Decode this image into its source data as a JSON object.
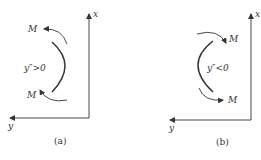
{
  "diagram": {
    "colors": {
      "line": "#333333",
      "background": "#ffffff"
    },
    "panels": [
      {
        "id": "a",
        "caption": "(a)",
        "x_axis_label": "x",
        "y_axis_label": "y",
        "moment_top_label": "M",
        "moment_bottom_label": "M",
        "curvature_label": "y″>0",
        "curve_bulge": "right"
      },
      {
        "id": "b",
        "caption": "(b)",
        "x_axis_label": "x",
        "y_axis_label": "y",
        "moment_top_label": "M",
        "moment_bottom_label": "M",
        "curvature_label": "y″<0",
        "curve_bulge": "left"
      }
    ]
  }
}
